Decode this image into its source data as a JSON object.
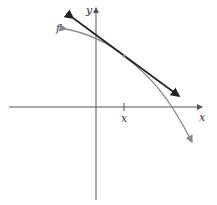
{
  "diagram": {
    "axes": {
      "x_label": "x",
      "y_label": "y"
    },
    "curve": {
      "label": "f",
      "color": "#8a8a8a"
    },
    "tangent_line": {
      "color": "#222222"
    },
    "tick": {
      "label": "x"
    },
    "colors": {
      "axes": "#555555",
      "curve": "#8a8a8a",
      "tangent": "#222222"
    }
  }
}
